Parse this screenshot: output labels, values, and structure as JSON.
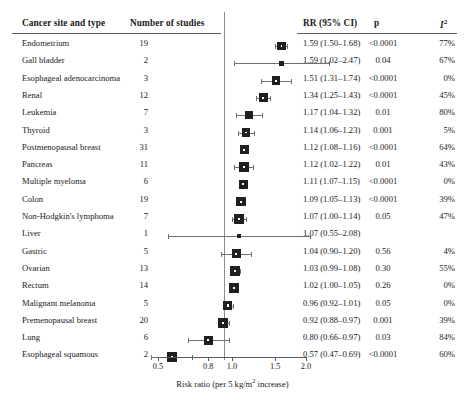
{
  "header": {
    "site_label": "Cancer site and type",
    "studies_label": "Number of studies",
    "rr_label": "RR (95% CI)",
    "p_label": "p",
    "i2_label": "I",
    "i2_sup": "2"
  },
  "axis": {
    "title_main": "Risk ratio (per 5 kg/m",
    "title_sup": "2",
    "title_tail": " increase)",
    "ticks": [
      "0.5",
      "0.8",
      "1.0",
      "1.5",
      "2.0"
    ],
    "tick_values": [
      0.5,
      0.8,
      1.0,
      1.5,
      2.0
    ],
    "scale": "log",
    "xlim": [
      0.45,
      2.15
    ],
    "reference_line": 1.0
  },
  "colors": {
    "marker": "#1f1f1f",
    "ci_line": "#6f6f6f",
    "rule": "#5a5a5a",
    "reference": "#8d8d8d",
    "text": "#1a1a1a",
    "background": "#ffffff"
  },
  "chart_data": {
    "type": "forest",
    "title": "",
    "xlabel": "Risk ratio (per 5 kg/m2 increase)",
    "ylabel": "Cancer site and type",
    "xscale": "log",
    "xlim": [
      0.45,
      2.15
    ],
    "reference_line": 1.0,
    "columns": [
      "Cancer site and type",
      "Number of studies",
      "RR (95% CI)",
      "p",
      "I2"
    ],
    "rows": [
      {
        "site": "Endometrium",
        "n": "19",
        "rr": 1.59,
        "lo": 1.5,
        "hi": 1.68,
        "rr_text": "1.59 (1.50–1.68)",
        "p": "<0.0001",
        "i2": "77%",
        "weight": 8.5
      },
      {
        "site": "Gall bladder",
        "n": "2",
        "rr": 1.59,
        "lo": 1.02,
        "hi": 2.47,
        "rr_text": "1.59 (1.02–2.47)",
        "p": "0.04",
        "i2": "67%",
        "weight": 5.0
      },
      {
        "site": "Esophageal adenocarcinoma",
        "n": "3",
        "rr": 1.51,
        "lo": 1.31,
        "hi": 1.74,
        "rr_text": "1.51 (1.31–1.74)",
        "p": "<0.0001",
        "i2": "0%",
        "weight": 8.5
      },
      {
        "site": "Renal",
        "n": "12",
        "rr": 1.34,
        "lo": 1.25,
        "hi": 1.43,
        "rr_text": "1.34 (1.25–1.43)",
        "p": "<0.0001",
        "i2": "45%",
        "weight": 9.0
      },
      {
        "site": "Leukemia",
        "n": "7",
        "rr": 1.17,
        "lo": 1.04,
        "hi": 1.32,
        "rr_text": "1.17 (1.04–1.32)",
        "p": "0.01",
        "i2": "80%",
        "weight": 8.0
      },
      {
        "site": "Thyroid",
        "n": "3",
        "rr": 1.14,
        "lo": 1.06,
        "hi": 1.23,
        "rr_text": "1.14 (1.06–1.23)",
        "p": "0.001",
        "i2": "5%",
        "weight": 8.5
      },
      {
        "site": "Postmenopausal breast",
        "n": "31",
        "rr": 1.12,
        "lo": 1.08,
        "hi": 1.16,
        "rr_text": "1.12 (1.08–1.16)",
        "p": "<0.0001",
        "i2": "64%",
        "weight": 9.0
      },
      {
        "site": "Pancreas",
        "n": "11",
        "rr": 1.12,
        "lo": 1.02,
        "hi": 1.22,
        "rr_text": "1.12 (1.02–1.22)",
        "p": "0.01",
        "i2": "43%",
        "weight": 10.0
      },
      {
        "site": "Multiple myeloma",
        "n": "6",
        "rr": 1.11,
        "lo": 1.07,
        "hi": 1.15,
        "rr_text": "1.11 (1.07–1.15)",
        "p": "<0.0001",
        "i2": "0%",
        "weight": 9.0
      },
      {
        "site": "Colon",
        "n": "19",
        "rr": 1.09,
        "lo": 1.05,
        "hi": 1.13,
        "rr_text": "1.09 (1.05–1.13)",
        "p": "<0.0001",
        "i2": "39%",
        "weight": 9.5
      },
      {
        "site": "Non-Hodgkin's lymphoma",
        "n": "7",
        "rr": 1.07,
        "lo": 1.0,
        "hi": 1.14,
        "rr_text": "1.07 (1.00–1.14)",
        "p": "0.05",
        "i2": "47%",
        "weight": 10.0
      },
      {
        "site": "Liver",
        "n": "1",
        "rr": 1.07,
        "lo": 0.55,
        "hi": 2.08,
        "rr_text": "1.07 (0.55–2.08)",
        "p": "",
        "i2": "",
        "weight": 4.0
      },
      {
        "site": "Gastric",
        "n": "5",
        "rr": 1.04,
        "lo": 0.9,
        "hi": 1.2,
        "rr_text": "1.04 (0.90–1.20)",
        "p": "0.56",
        "i2": "4%",
        "weight": 9.0
      },
      {
        "site": "Ovarian",
        "n": "13",
        "rr": 1.03,
        "lo": 0.99,
        "hi": 1.08,
        "rr_text": "1.03 (0.99–1.08)",
        "p": "0.30",
        "i2": "55%",
        "weight": 10.0
      },
      {
        "site": "Rectum",
        "n": "14",
        "rr": 1.02,
        "lo": 1.0,
        "hi": 1.05,
        "rr_text": "1.02 (1.00–1.05)",
        "p": "0.26",
        "i2": "0%",
        "weight": 9.5
      },
      {
        "site": "Malignant melanoma",
        "n": "5",
        "rr": 0.96,
        "lo": 0.92,
        "hi": 1.01,
        "rr_text": "0.96 (0.92–1.01)",
        "p": "0.05",
        "i2": "0%",
        "weight": 9.5
      },
      {
        "site": "Premenopausal breast",
        "n": "20",
        "rr": 0.92,
        "lo": 0.88,
        "hi": 0.97,
        "rr_text": "0.92 (0.88–0.97)",
        "p": "0.001",
        "i2": "39%",
        "weight": 10.0
      },
      {
        "site": "Lung",
        "n": "6",
        "rr": 0.8,
        "lo": 0.66,
        "hi": 0.97,
        "rr_text": "0.80 (0.66–0.97)",
        "p": "0.03",
        "i2": "84%",
        "weight": 9.0
      },
      {
        "site": "Esophageal squamous",
        "n": "2",
        "rr": 0.57,
        "lo": 0.47,
        "hi": 0.69,
        "rr_text": "0.57 (0.47–0.69)",
        "p": "<0.0001",
        "i2": "60%",
        "weight": 10.0
      }
    ]
  }
}
